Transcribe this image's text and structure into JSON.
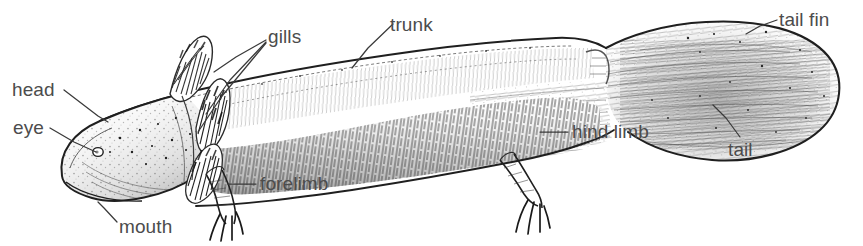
{
  "figure": {
    "kind": "labeled-anatomical-illustration",
    "style": "pen-and-ink hatched line drawing",
    "background_color": "#ffffff",
    "ink_color": "#2b2b2b",
    "label_color": "#4c4c4c",
    "leader_color": "#3a3a3a",
    "width": 863,
    "height": 246
  },
  "labels": [
    {
      "id": "head",
      "text": "head",
      "x": 12,
      "y": 80,
      "align": "left"
    },
    {
      "id": "eye",
      "text": "eye",
      "x": 13,
      "y": 118,
      "align": "left"
    },
    {
      "id": "mouth",
      "text": "mouth",
      "x": 119,
      "y": 217,
      "align": "left"
    },
    {
      "id": "gills",
      "text": "gills",
      "x": 268,
      "y": 27,
      "align": "left"
    },
    {
      "id": "forelimb",
      "text": "forelimb",
      "x": 260,
      "y": 174,
      "align": "left"
    },
    {
      "id": "trunk",
      "text": "trunk",
      "x": 390,
      "y": 15,
      "align": "left"
    },
    {
      "id": "hind-limb",
      "text": "hind limb",
      "x": 572,
      "y": 122,
      "align": "left"
    },
    {
      "id": "tail",
      "text": "tail",
      "x": 728,
      "y": 140,
      "align": "left"
    },
    {
      "id": "tail-fin",
      "text": "tail fin",
      "x": 779,
      "y": 10,
      "align": "left"
    }
  ],
  "leader_lines": [
    {
      "for": "head",
      "points": "64,90 98,116 108,122"
    },
    {
      "for": "eye",
      "points": "50,128 74,142 96,152"
    },
    {
      "for": "mouth",
      "points": "117,222 104,208 98,202"
    },
    {
      "for": "gills",
      "points": "266,40 236,57 214,72"
    },
    {
      "for": "gills-2",
      "points": "266,42 230,80 206,114"
    },
    {
      "for": "gills-3",
      "points": "266,43 222,96 198,132"
    },
    {
      "for": "forelimb",
      "points": "256,184 228,184"
    },
    {
      "for": "trunk",
      "points": "393,24 368,48 352,68"
    },
    {
      "for": "hind-limb",
      "points": "568,132 540,132"
    },
    {
      "for": "tail",
      "points": "740,137 726,118 713,105"
    },
    {
      "for": "tail-fin",
      "points": "777,20 760,26 746,34"
    }
  ],
  "anatomy_parts": [
    "head",
    "eye",
    "mouth",
    "gills",
    "forelimb",
    "trunk",
    "hind limb",
    "tail",
    "tail fin"
  ]
}
